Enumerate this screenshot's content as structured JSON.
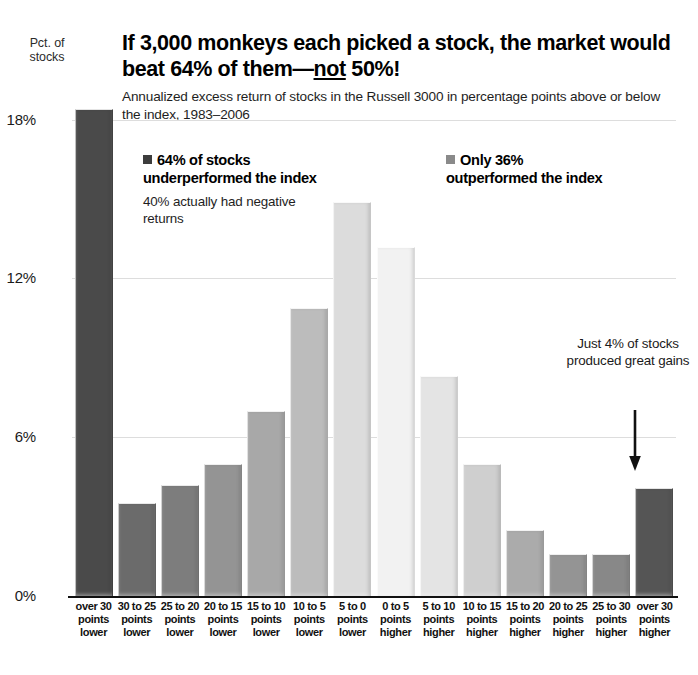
{
  "header": {
    "axis_unit_label": "Pct. of\nstocks",
    "title_part1": "If 3,000 monkeys each picked a stock, the market would beat 64% of them—",
    "title_emphasis": "not",
    "title_part2": " 50%!",
    "title_full": "If 3,000 monkeys each picked a stock, the market would beat 64% of them—not 50%!",
    "subtitle": "Annualized excess return of stocks in the Russell 3000 in percentage points above or below the index, 1983–2006"
  },
  "annotations": {
    "left": {
      "headline": "64% of stocks underperformed the index",
      "subline": "40% actually had negative returns",
      "swatch_color": "#3d3d3d"
    },
    "right": {
      "headline": "Only 36% outperformed the index",
      "swatch_color": "#8a8a8a"
    },
    "callout": {
      "text": "Just 4% of stocks produced great gains",
      "arrow": "down-arrow"
    }
  },
  "chart_data": {
    "type": "bar",
    "title": "If 3,000 monkeys each picked a stock, the market would beat 64% of them—not 50%!",
    "subtitle": "Annualized excess return of stocks in the Russell 3000 in percentage points above or below the index, 1983–2006",
    "xlabel": "",
    "ylabel": "Pct. of stocks",
    "ylim": [
      0,
      19.5
    ],
    "yticks": [
      0,
      6,
      12,
      18
    ],
    "ytick_labels": [
      "0%",
      "6%",
      "12%",
      "18%"
    ],
    "grid": true,
    "legend_position": "inside",
    "categories": [
      "over 30 points lower",
      "30 to 25 points lower",
      "25 to 20 points lower",
      "20 to 15 points lower",
      "15 to 10 points lower",
      "10 to 5 points lower",
      "5 to 0 points lower",
      "0 to 5 points higher",
      "5 to 10 points higher",
      "10 to 15 points higher",
      "15 to 20 points higher",
      "20 to 25 points higher",
      "25 to 30 points higher",
      "over 30 points higher"
    ],
    "category_lines": [
      [
        "over 30",
        "points",
        "lower"
      ],
      [
        "30 to 25",
        "points",
        "lower"
      ],
      [
        "25 to 20",
        "points",
        "lower"
      ],
      [
        "20 to 15",
        "points",
        "lower"
      ],
      [
        "15 to 10",
        "points",
        "lower"
      ],
      [
        "10 to 5",
        "points",
        "lower"
      ],
      [
        "5 to 0",
        "points",
        "lower"
      ],
      [
        "0 to 5",
        "points",
        "higher"
      ],
      [
        "5 to 10",
        "points",
        "higher"
      ],
      [
        "10 to 15",
        "points",
        "higher"
      ],
      [
        "15 to 20",
        "points",
        "higher"
      ],
      [
        "20 to 25",
        "points",
        "higher"
      ],
      [
        "25 to 30",
        "points",
        "higher"
      ],
      [
        "over 30",
        "points",
        "higher"
      ]
    ],
    "values": [
      18.4,
      3.5,
      4.2,
      5.0,
      7.0,
      10.9,
      14.9,
      13.2,
      8.3,
      5.0,
      2.5,
      1.6,
      1.6,
      4.1
    ],
    "bar_colors": [
      "#4a4a4a",
      "#6b6b6b",
      "#7d7d7d",
      "#949494",
      "#a8a8a8",
      "#bcbcbc",
      "#dcdcdc",
      "#f2f2f2",
      "#e4e4e4",
      "#cfcfcf",
      "#ababab",
      "#949494",
      "#888888",
      "#555555"
    ]
  }
}
